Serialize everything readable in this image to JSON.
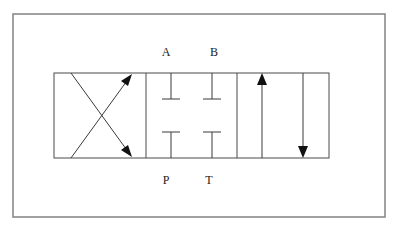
{
  "diagram": {
    "type": "directional-control-valve-symbol",
    "ports": {
      "top": [
        "A",
        "B"
      ],
      "bottom": [
        "P",
        "T"
      ]
    },
    "positions": [
      {
        "name": "crossed",
        "paths": [
          "P-B",
          "A-T"
        ],
        "arrows": [
          "diagonal-up-right",
          "diagonal-down-right"
        ]
      },
      {
        "name": "closed-center",
        "paths": [],
        "arrows": []
      },
      {
        "name": "parallel",
        "paths": [
          "P-A",
          "B-T"
        ],
        "arrows": [
          "up",
          "down"
        ]
      }
    ],
    "colors": {
      "line": "#3a3a3a",
      "frame": "#8a8a8a",
      "arrowhead": "#111111"
    }
  },
  "labels": {
    "A": "A",
    "B": "B",
    "P": "P",
    "T": "T"
  }
}
